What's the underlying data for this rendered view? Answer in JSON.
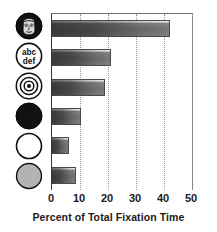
{
  "chart_data": {
    "type": "bar",
    "orientation": "horizontal",
    "title": "",
    "xlabel": "Percent of Total Fixation Time",
    "ylabel": "",
    "xlim": [
      0,
      50.7
    ],
    "xticks": [
      0,
      10,
      20,
      30,
      40,
      50
    ],
    "xtick_labels": [
      "0",
      "10",
      "20",
      "30",
      "40",
      "50"
    ],
    "grid": "vertical dotted gridlines at each x tick",
    "legend": "none",
    "categories": [
      "face-icon",
      "text-abc-def-icon",
      "concentric-circles-icon",
      "black-filled-circle-icon",
      "white-outline-circle-icon",
      "gray-filled-circle-icon"
    ],
    "category_labels": [
      "",
      "abc\ndef",
      "",
      "",
      "",
      ""
    ],
    "values": [
      42.0,
      21.0,
      19.0,
      10.5,
      6.0,
      8.5
    ],
    "bar_style": "gray gradient fill, dark outline, white top highlight"
  },
  "axis": {
    "x_title": "Percent of Total Fixation Time",
    "ticks": [
      {
        "value": 0,
        "label": "0"
      },
      {
        "value": 10,
        "label": "10"
      },
      {
        "value": 20,
        "label": "20"
      },
      {
        "value": 30,
        "label": "30"
      },
      {
        "value": 40,
        "label": "40"
      },
      {
        "value": 50,
        "label": "50"
      }
    ]
  },
  "categories": [
    {
      "icon": "face-icon",
      "label": "",
      "value": 42.0
    },
    {
      "icon": "text-abc-def-icon",
      "label_line1": "abc",
      "label_line2": "def",
      "value": 21.0
    },
    {
      "icon": "concentric-circles-icon",
      "label": "",
      "value": 19.0
    },
    {
      "icon": "black-filled-circle-icon",
      "label": "",
      "value": 10.5
    },
    {
      "icon": "white-outline-circle-icon",
      "label": "",
      "value": 6.0
    },
    {
      "icon": "gray-filled-circle-icon",
      "label": "",
      "value": 8.5
    }
  ],
  "colors": {
    "bar_dark": "#6e6e6e",
    "bar_light": "#eeeeee",
    "bar_outline": "#4a4a4a",
    "axis": "#3a3a3a",
    "gridline": "#9a9a9a",
    "text": "#1a1a1a",
    "icon_fill_black": "#111111",
    "icon_fill_gray": "#b3b3b3",
    "icon_fill_white": "#ffffff"
  }
}
